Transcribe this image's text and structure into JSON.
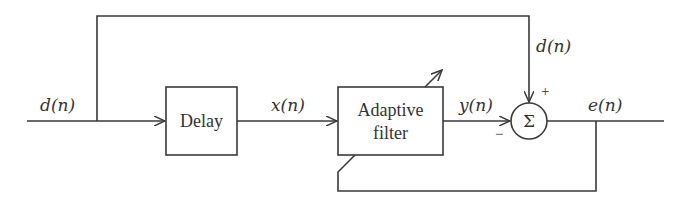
{
  "diagram": {
    "type": "block-diagram",
    "colors": {
      "stroke": "#3a3a3a",
      "text": "#333333",
      "background": "#ffffff"
    },
    "signals": {
      "input": "d(n)",
      "delayed_input": "x(n)",
      "filter_output": "y(n)",
      "desired_branch": "d(n)",
      "error": "e(n)"
    },
    "blocks": {
      "delay": {
        "label": "Delay"
      },
      "adaptive_filter": {
        "label_line1": "Adaptive",
        "label_line2": "filter"
      },
      "summer": {
        "symbol": "Σ",
        "plus_sign": "+",
        "minus_sign": "−"
      }
    },
    "connections": [
      {
        "from": "input d(n)",
        "to": "Delay"
      },
      {
        "from": "Delay",
        "to": "Adaptive filter",
        "signal": "x(n)"
      },
      {
        "from": "Adaptive filter",
        "to": "Σ (−)",
        "signal": "y(n)"
      },
      {
        "from": "input d(n) (top branch)",
        "to": "Σ (+)",
        "signal": "d(n)"
      },
      {
        "from": "Σ",
        "to": "output",
        "signal": "e(n)"
      },
      {
        "from": "e(n)",
        "to": "Adaptive filter (adaptation feedback)"
      }
    ]
  }
}
